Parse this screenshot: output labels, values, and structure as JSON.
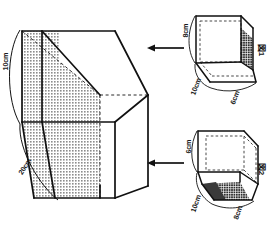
{
  "document": {
    "title": "立体図形の問題図",
    "background_color": "#ffffff",
    "line_color": "#1a1a1a",
    "shade_color": "#9a9a9a",
    "dark_shade_color": "#4f4f4f"
  },
  "main_solid": {
    "name": "main-prism",
    "description": "大きな直方体から斜めに切り取られた立体。左側面に斜めの影付き断面。",
    "labels": [
      {
        "key": "height",
        "text": "10cm",
        "rotation": -90,
        "position": "left-upper"
      },
      {
        "key": "depth",
        "text": "20cm",
        "rotation": -55,
        "position": "left-lower"
      }
    ]
  },
  "figures": [
    {
      "id": "fig1",
      "name": "図1",
      "caption": "図1",
      "caption_rotation": 90,
      "labels": [
        {
          "key": "height",
          "text": "8cm",
          "rotation": -90,
          "position": "left"
        },
        {
          "key": "depth",
          "text": "10cm",
          "rotation": -55,
          "position": "bottom-left"
        },
        {
          "key": "width",
          "text": "6cm",
          "rotation": -55,
          "position": "bottom-right"
        }
      ],
      "shaded_face": "right-end"
    },
    {
      "id": "fig2",
      "name": "図2",
      "caption": "図2",
      "caption_rotation": 90,
      "labels": [
        {
          "key": "height",
          "text": "6cm",
          "rotation": -90,
          "position": "left"
        },
        {
          "key": "depth",
          "text": "10cm",
          "rotation": -55,
          "position": "bottom-left"
        },
        {
          "key": "width",
          "text": "8cm",
          "rotation": -55,
          "position": "bottom-right"
        }
      ],
      "shaded_face": "bottom"
    }
  ],
  "arrows": [
    {
      "key": "arrow-fig1",
      "direction": "left",
      "from": "fig1",
      "to": "main-prism"
    },
    {
      "key": "arrow-fig2",
      "direction": "left",
      "from": "fig2",
      "to": "main-prism"
    }
  ]
}
